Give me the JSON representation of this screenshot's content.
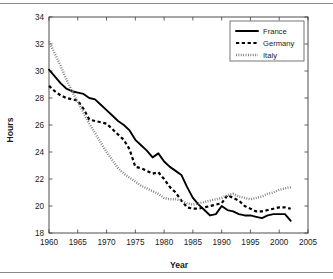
{
  "figure": {
    "name": "working-hours-line-chart",
    "background": "#ffffff",
    "rule_color": "#8a8a8a"
  },
  "chart_data": {
    "type": "line",
    "title": "",
    "xlabel": "Year",
    "ylabel": "Hours",
    "xlim": [
      1960,
      2005
    ],
    "ylim": [
      18,
      34
    ],
    "xticks": [
      1960,
      1965,
      1970,
      1975,
      1980,
      1985,
      1990,
      1995,
      2000,
      2005
    ],
    "yticks": [
      18,
      20,
      22,
      24,
      26,
      28,
      30,
      32,
      34
    ],
    "xtick_labels": [
      "1960",
      "1965",
      "1970",
      "1975",
      "1980",
      "1985",
      "1990",
      "1995",
      "2000",
      "2005"
    ],
    "ytick_labels": [
      "18",
      "20",
      "22",
      "24",
      "26",
      "28",
      "30",
      "32",
      "34"
    ],
    "grid": false,
    "legend_position": "top-right",
    "x": [
      1960,
      1961,
      1962,
      1963,
      1964,
      1965,
      1966,
      1967,
      1968,
      1969,
      1970,
      1971,
      1972,
      1973,
      1974,
      1975,
      1976,
      1977,
      1978,
      1979,
      1980,
      1981,
      1982,
      1983,
      1984,
      1985,
      1986,
      1987,
      1988,
      1989,
      1990,
      1991,
      1992,
      1993,
      1994,
      1995,
      1996,
      1997,
      1998,
      1999,
      2000,
      2001,
      2002
    ],
    "series": [
      {
        "name": "France",
        "style": "solid",
        "color": "#000000",
        "values": [
          30.1,
          29.6,
          29.1,
          28.7,
          28.5,
          28.4,
          28.3,
          28.0,
          27.9,
          27.5,
          27.1,
          26.7,
          26.3,
          26.0,
          25.6,
          24.9,
          24.5,
          24.1,
          23.6,
          23.9,
          23.3,
          22.9,
          22.6,
          22.3,
          21.4,
          20.6,
          20.1,
          19.7,
          19.3,
          19.4,
          20.0,
          19.7,
          19.6,
          19.4,
          19.3,
          19.3,
          19.2,
          19.1,
          19.3,
          19.4,
          19.4,
          19.4,
          18.9
        ]
      },
      {
        "name": "Germany",
        "style": "dashed",
        "color": "#000000",
        "values": [
          28.9,
          28.5,
          28.2,
          28.0,
          27.9,
          27.8,
          27.2,
          26.4,
          26.3,
          26.2,
          26.1,
          25.7,
          25.3,
          24.9,
          24.2,
          22.9,
          22.8,
          22.6,
          22.4,
          22.5,
          22.0,
          21.4,
          21.0,
          20.4,
          19.9,
          19.8,
          19.8,
          19.9,
          20.0,
          20.1,
          20.2,
          20.8,
          20.6,
          20.4,
          20.0,
          19.8,
          19.6,
          19.6,
          19.7,
          19.8,
          19.9,
          19.9,
          19.8
        ]
      },
      {
        "name": "Italy",
        "style": "dotted",
        "color": "#7a7a7a",
        "values": [
          32.2,
          31.3,
          30.4,
          29.4,
          28.5,
          27.7,
          26.9,
          26.1,
          25.4,
          24.7,
          24.0,
          23.4,
          22.8,
          22.4,
          22.1,
          21.8,
          21.5,
          21.3,
          21.1,
          20.9,
          20.6,
          20.5,
          20.5,
          20.4,
          20.2,
          20.1,
          20.2,
          20.3,
          20.4,
          20.5,
          20.6,
          20.8,
          20.9,
          20.7,
          20.6,
          20.5,
          20.6,
          20.7,
          20.9,
          21.0,
          21.2,
          21.3,
          21.4
        ]
      }
    ],
    "legend": [
      {
        "label": "France",
        "style": "solid",
        "color": "#000000"
      },
      {
        "label": "Germany",
        "style": "dashed",
        "color": "#000000"
      },
      {
        "label": "Italy",
        "style": "dotted",
        "color": "#7a7a7a"
      }
    ]
  }
}
